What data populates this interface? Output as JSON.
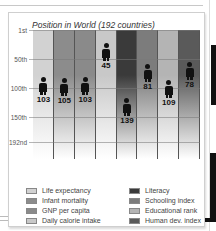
{
  "chart_data": {
    "type": "bar",
    "title": "Position in World (192 countries)",
    "xlabel": "",
    "ylabel": "",
    "ylim": [
      1,
      192
    ],
    "y_inverted": true,
    "yticks": [
      "1st",
      "50th",
      "100th",
      "150th",
      "192nd"
    ],
    "grid": true,
    "legend_position": "bottom",
    "categories": [
      "Life expectancy",
      "Infant mortality",
      "GNP per capita",
      "Daily calorie intake",
      "Literacy",
      "Schooling index",
      "Educational rank",
      "Human dev. index"
    ],
    "values": [
      103,
      105,
      103,
      45,
      139,
      81,
      109,
      78
    ],
    "colors": [
      "#d2d2d2",
      "#8c8c8c",
      "#8a8a8a",
      "#c8c8c8",
      "#3a3a3a",
      "#7c7c7c",
      "#b4b4b4",
      "#5a5a5a"
    ]
  },
  "chart": {
    "title": "Position in World (192 countries)",
    "yticks": [
      {
        "label": "1st",
        "rank": 1
      },
      {
        "label": "50th",
        "rank": 50
      },
      {
        "label": "100th",
        "rank": 100
      },
      {
        "label": "150th",
        "rank": 150
      },
      {
        "label": "192nd",
        "rank": 192
      }
    ],
    "bars": [
      {
        "label": "Life expectancy",
        "value": "103",
        "color": "#d2d2d2"
      },
      {
        "label": "Infant mortality",
        "value": "105",
        "color": "#8c8c8c"
      },
      {
        "label": "GNP per capita",
        "value": "103",
        "color": "#8a8a8a"
      },
      {
        "label": "Daily calorie intake",
        "value": "45",
        "color": "#c8c8c8"
      },
      {
        "label": "Literacy",
        "value": "139",
        "color": "#3a3a3a"
      },
      {
        "label": "Schooling index",
        "value": "81",
        "color": "#7c7c7c"
      },
      {
        "label": "Educational rank",
        "value": "109",
        "color": "#b4b4b4"
      },
      {
        "label": "Human dev. index",
        "value": "78",
        "color": "#5a5a5a"
      }
    ]
  },
  "legend": {
    "items": [
      {
        "label": "Life expectancy",
        "color": "#d2d2d2"
      },
      {
        "label": "Infant mortality",
        "color": "#8c8c8c"
      },
      {
        "label": "GNP per capita",
        "color": "#8a8a8a"
      },
      {
        "label": "Daily calorie intake",
        "color": "#c8c8c8"
      },
      {
        "label": "Literacy",
        "color": "#3a3a3a"
      },
      {
        "label": "Schooling index",
        "color": "#7c7c7c"
      },
      {
        "label": "Educational rank",
        "color": "#b4b4b4"
      },
      {
        "label": "Human dev. index",
        "color": "#5a5a5a"
      }
    ]
  }
}
